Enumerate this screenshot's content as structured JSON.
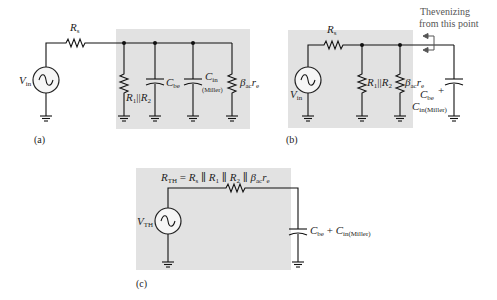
{
  "panels": {
    "a": {
      "caption": "(a)",
      "source": {
        "label": "V",
        "sub": "in"
      },
      "series_resistor": {
        "label": "R",
        "sub": "s"
      },
      "parallel_resistor": {
        "label": "R",
        "sub1": "1",
        "sep": "||",
        "label2": "R",
        "sub2": "2"
      },
      "cap_be": {
        "label": "C",
        "sub": "be"
      },
      "cap_miller": {
        "label": "C",
        "sub": "in",
        "note": "(Miller)"
      },
      "beta_resistor": {
        "label": "β",
        "sub": "ac",
        "label2": "r",
        "sub2": "e"
      }
    },
    "b": {
      "caption": "(b)",
      "source": {
        "label": "V",
        "sub": "in"
      },
      "series_resistor": {
        "label": "R",
        "sub": "s"
      },
      "parallel_resistor": {
        "label": "R",
        "sub1": "1",
        "sep": "||",
        "label2": "R",
        "sub2": "2"
      },
      "beta_resistor": {
        "label": "β",
        "sub": "ac",
        "label2": "r",
        "sub2": "e"
      },
      "cap_total": {
        "line1_label": "C",
        "line1_sub": "be",
        "plus": "+",
        "line2_label": "C",
        "line2_sub": "in(Miller)"
      },
      "annotation": {
        "line1": "Thevenizing",
        "line2": "from this point"
      }
    },
    "c": {
      "caption": "(c)",
      "source": {
        "label": "V",
        "sub": "TH"
      },
      "rth_equation": {
        "lhs": "R",
        "lhs_sub": "TH",
        "eq": " = ",
        "t1": "R",
        "t1_sub": "s",
        "p1": " ∥ ",
        "t2": "R",
        "t2_sub": "1",
        "p2": " ∥ ",
        "t3": "R",
        "t3_sub": "2",
        "p3": " ∥ ",
        "t4": "β",
        "t4_sub": "ac",
        "t5": "r",
        "t5_sub": "e"
      },
      "cap_total": {
        "label": "C",
        "sub": "be",
        "plus": " + ",
        "label2": "C",
        "sub2": "in(Miller)"
      }
    }
  },
  "colors": {
    "panel_fill": "#e2e2e2",
    "wire": "#111111",
    "text": "#222222",
    "annotation": "#555555"
  }
}
